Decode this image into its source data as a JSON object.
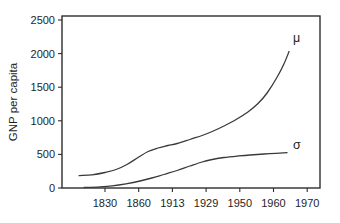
{
  "colors": {
    "line": "#3a3a3a",
    "axis": "#2e2e2e",
    "text": "#1e1e1e",
    "background": "#ffffff"
  },
  "chart_data": {
    "type": "line",
    "title": "",
    "xlabel": "",
    "ylabel": "GNP per capita",
    "x_tick_labels": [
      "1830",
      "1860",
      "1913",
      "1929",
      "1950",
      "1960",
      "1970"
    ],
    "y_ticks": [
      0,
      500,
      1000,
      1500,
      2000,
      2500
    ],
    "ylim": [
      0,
      2500
    ],
    "grid": false,
    "legend_position": "inline end-of-curve labels",
    "x_note": "x given in tick-index units (0 = 1830 tick ... 6 = 1970 tick); ticks are evenly spaced although year intervals differ; curves begin left of the 1830 tick (~1820) and end between the 1960 and 1970 ticks (~1965)",
    "series": [
      {
        "name": "mu",
        "label": "μ",
        "approx_values_at_ticks": [
          230,
          450,
          650,
          820,
          1060,
          1570,
          null
        ],
        "end_value": 2030,
        "points": [
          [
            -0.77,
            185
          ],
          [
            -0.39,
            196
          ],
          [
            0.0,
            231
          ],
          [
            0.33,
            275
          ],
          [
            0.65,
            350
          ],
          [
            0.98,
            454
          ],
          [
            1.28,
            543
          ],
          [
            1.57,
            595
          ],
          [
            1.87,
            632
          ],
          [
            2.14,
            662
          ],
          [
            2.52,
            722
          ],
          [
            2.88,
            781
          ],
          [
            3.18,
            841
          ],
          [
            3.53,
            923
          ],
          [
            3.89,
            1019
          ],
          [
            4.24,
            1131
          ],
          [
            4.54,
            1257
          ],
          [
            4.81,
            1414
          ],
          [
            5.1,
            1644
          ],
          [
            5.31,
            1845
          ],
          [
            5.46,
            2031
          ]
        ]
      },
      {
        "name": "sigma",
        "label": "σ",
        "approx_values_at_ticks": [
          25,
          100,
          240,
          410,
          478,
          514,
          null
        ],
        "end_value": 525,
        "points": [
          [
            -0.62,
            7
          ],
          [
            -0.15,
            18
          ],
          [
            0.21,
            33
          ],
          [
            0.62,
            63
          ],
          [
            1.04,
            104
          ],
          [
            1.39,
            149
          ],
          [
            1.75,
            201
          ],
          [
            2.14,
            260
          ],
          [
            2.52,
            327
          ],
          [
            2.88,
            387
          ],
          [
            3.18,
            424
          ],
          [
            3.53,
            454
          ],
          [
            3.95,
            476
          ],
          [
            4.3,
            491
          ],
          [
            4.72,
            506
          ],
          [
            5.07,
            516
          ],
          [
            5.4,
            525
          ]
        ]
      }
    ]
  }
}
